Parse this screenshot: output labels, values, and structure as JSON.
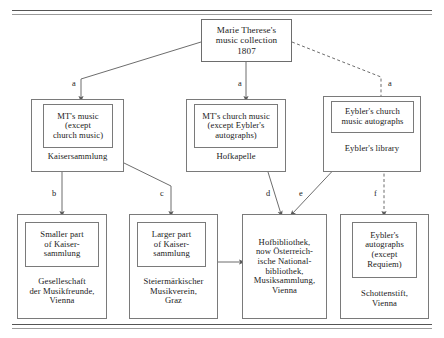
{
  "diagram": {
    "title_node": {
      "lines": [
        "Marie Therese's",
        "music collection",
        "1807"
      ]
    },
    "mid_nodes": [
      {
        "id": "kaisersammlung",
        "inner_lines": [
          "MT's music",
          "(except",
          "church music)"
        ],
        "outer_label": "Kaisersammlung"
      },
      {
        "id": "hofkapelle",
        "inner_lines": [
          "MT's church music",
          "(except Eybler's",
          "autographs)"
        ],
        "outer_label": "Hofkapelle"
      },
      {
        "id": "eyblers-library",
        "inner_lines": [
          "Eybler's church",
          "music autographs"
        ],
        "outer_label": "Eybler's library"
      }
    ],
    "bottom_nodes": [
      {
        "id": "gesellschaft",
        "inner_lines": [
          "Smaller part",
          "of Kaiser-",
          "sammlung"
        ],
        "outer_lines": [
          "Geselleschaft",
          "der Musikfreunde,",
          "Vienna"
        ]
      },
      {
        "id": "steiermark",
        "inner_lines": [
          "Larger part",
          "of Kaiser-",
          "sammlung"
        ],
        "outer_lines": [
          "Steiermärkischer",
          "Musikverein,",
          "Graz"
        ]
      },
      {
        "id": "hofbibliothek",
        "inner_lines": [],
        "outer_lines": [
          "Hofbibliothek,",
          "now Österreich-",
          "ische National-",
          "bibliothek,",
          "Musiksammlung,",
          "Vienna"
        ]
      },
      {
        "id": "schottenstift",
        "inner_lines": [
          "Eybler's",
          "autographs",
          "(except",
          "Requiem)"
        ],
        "outer_lines": [
          "Schottenstift,",
          "Vienna"
        ]
      }
    ],
    "edge_labels": {
      "a1": "a",
      "a2": "a",
      "a3": "a",
      "b": "b",
      "c": "c",
      "d": "d",
      "e": "e",
      "f": "f",
      "g": "g"
    },
    "colors": {
      "line": "#6d6d6d",
      "text": "#1a1a1a",
      "background": "#ffffff"
    }
  }
}
